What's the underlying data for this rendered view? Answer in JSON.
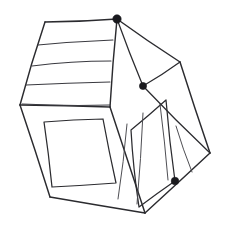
{
  "artwork": {
    "title": "Hand-drawn house sketch",
    "subject": "house",
    "medium": "pen line drawing",
    "background_color": "#ffffff",
    "ink_color": "#2b2b2f",
    "canvas": {
      "width": 228,
      "height": 235
    }
  },
  "faces": {
    "roof": {
      "name": "roof-face",
      "outline": "45,22 117,19 110,107 20,105",
      "shingle_lines": [
        "38,45 113,40",
        "32,66 111,61",
        "26,85 110,82",
        "22,104 110,105"
      ],
      "shingle_count": 4
    },
    "left_wall": {
      "name": "left-wall-face",
      "outline": "20,105 110,107 145,213 50,197",
      "window": {
        "name": "left-wall-window",
        "outline": "44,122 103,119 116,183 52,187"
      }
    },
    "right_wall": {
      "name": "right-wall-face",
      "outline": "117,19 180,62 210,153 145,213 110,107",
      "ridge": "117,19 143,86",
      "eave": "143,86 180,62",
      "lower_fold": "143,86 210,153",
      "inner_panel": {
        "name": "right-wall-inner-panel",
        "outline": "131,130 166,100 175,181 139,207"
      },
      "slat_lines": [
        "127,124 118,199",
        "143,113 137,204",
        "160,104 168,180",
        "176,126 192,172"
      ],
      "slat_count": 4
    }
  },
  "vertices": [
    {
      "name": "apex-vertex",
      "x": 117,
      "y": 19,
      "marked": true,
      "radius": 4.2
    },
    {
      "name": "eave-vertex",
      "x": 143,
      "y": 86,
      "marked": true,
      "radius": 3.6
    },
    {
      "name": "base-right-vertex",
      "x": 175,
      "y": 181,
      "marked": true,
      "radius": 3.8
    },
    {
      "name": "roof-left-vertex",
      "x": 45,
      "y": 22,
      "marked": false,
      "radius": 0
    },
    {
      "name": "wall-left-vertex",
      "x": 20,
      "y": 105,
      "marked": false,
      "radius": 0
    },
    {
      "name": "center-vertex",
      "x": 110,
      "y": 107,
      "marked": false,
      "radius": 0
    },
    {
      "name": "right-top-vertex",
      "x": 180,
      "y": 62,
      "marked": false,
      "radius": 0
    },
    {
      "name": "right-low-vertex",
      "x": 210,
      "y": 153,
      "marked": false,
      "radius": 0
    },
    {
      "name": "base-bottom-vertex",
      "x": 145,
      "y": 213,
      "marked": false,
      "radius": 0
    },
    {
      "name": "base-left-vertex",
      "x": 50,
      "y": 197,
      "marked": false,
      "radius": 0
    }
  ],
  "edges": {
    "roof_ridge_top": "45,22 117,19",
    "roof_left_slope": "45,22 20,105",
    "roof_front_edge": "20,105 110,107",
    "roof_hip": "117,19 110,107",
    "gable_right": "117,19 180,62",
    "wall_right_edge": "180,62 210,153",
    "base_right_edge": "210,153 145,213",
    "base_bottom_edge": "145,213 50,197",
    "wall_left_edge": "20,105 50,197"
  }
}
